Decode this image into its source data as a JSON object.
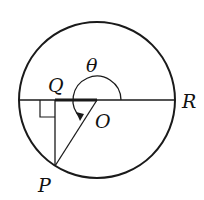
{
  "diagram": {
    "labels": {
      "theta": "θ",
      "Q": "Q",
      "R": "R",
      "O": "O",
      "P": "P"
    },
    "colors": {
      "stroke": "#1a1a1a",
      "background": "#ffffff"
    }
  }
}
